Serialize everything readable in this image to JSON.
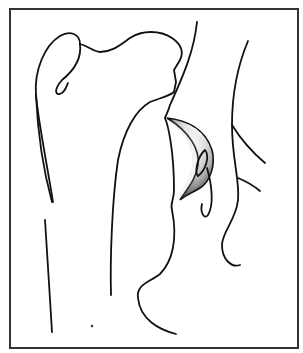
{
  "figure": {
    "type": "anatomical line drawing",
    "frame_color": "#333333",
    "line_color": "#111111",
    "shading_color": "#222222",
    "background": "#ffffff"
  }
}
